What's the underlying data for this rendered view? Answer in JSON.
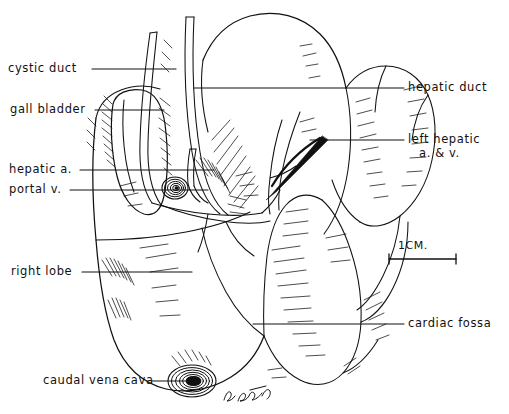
{
  "figure": {
    "medium": "pen-and-ink line drawing with hatch shading",
    "background_color": "#ffffff",
    "ink_color": "#111111"
  },
  "labels": {
    "cystic_duct": "cystic duct",
    "gall_bladder": "gall bladder",
    "hepatic_a": "hepatic a.",
    "portal_v": "portal v.",
    "right_lobe": "right lobe",
    "caudal_vena_cava": "caudal vena cava",
    "hepatic_duct": "hepatic duct",
    "left_hepatic_line1": "left hepatic",
    "left_hepatic_line2": "a. & v.",
    "cardiac_fossa": "cardiac fossa"
  },
  "scale_bar": {
    "text": "1CM.",
    "length_px": 67,
    "unit": "CM"
  },
  "signature": {
    "text": "B. Bagdon",
    "style": "cursive artist signature"
  }
}
